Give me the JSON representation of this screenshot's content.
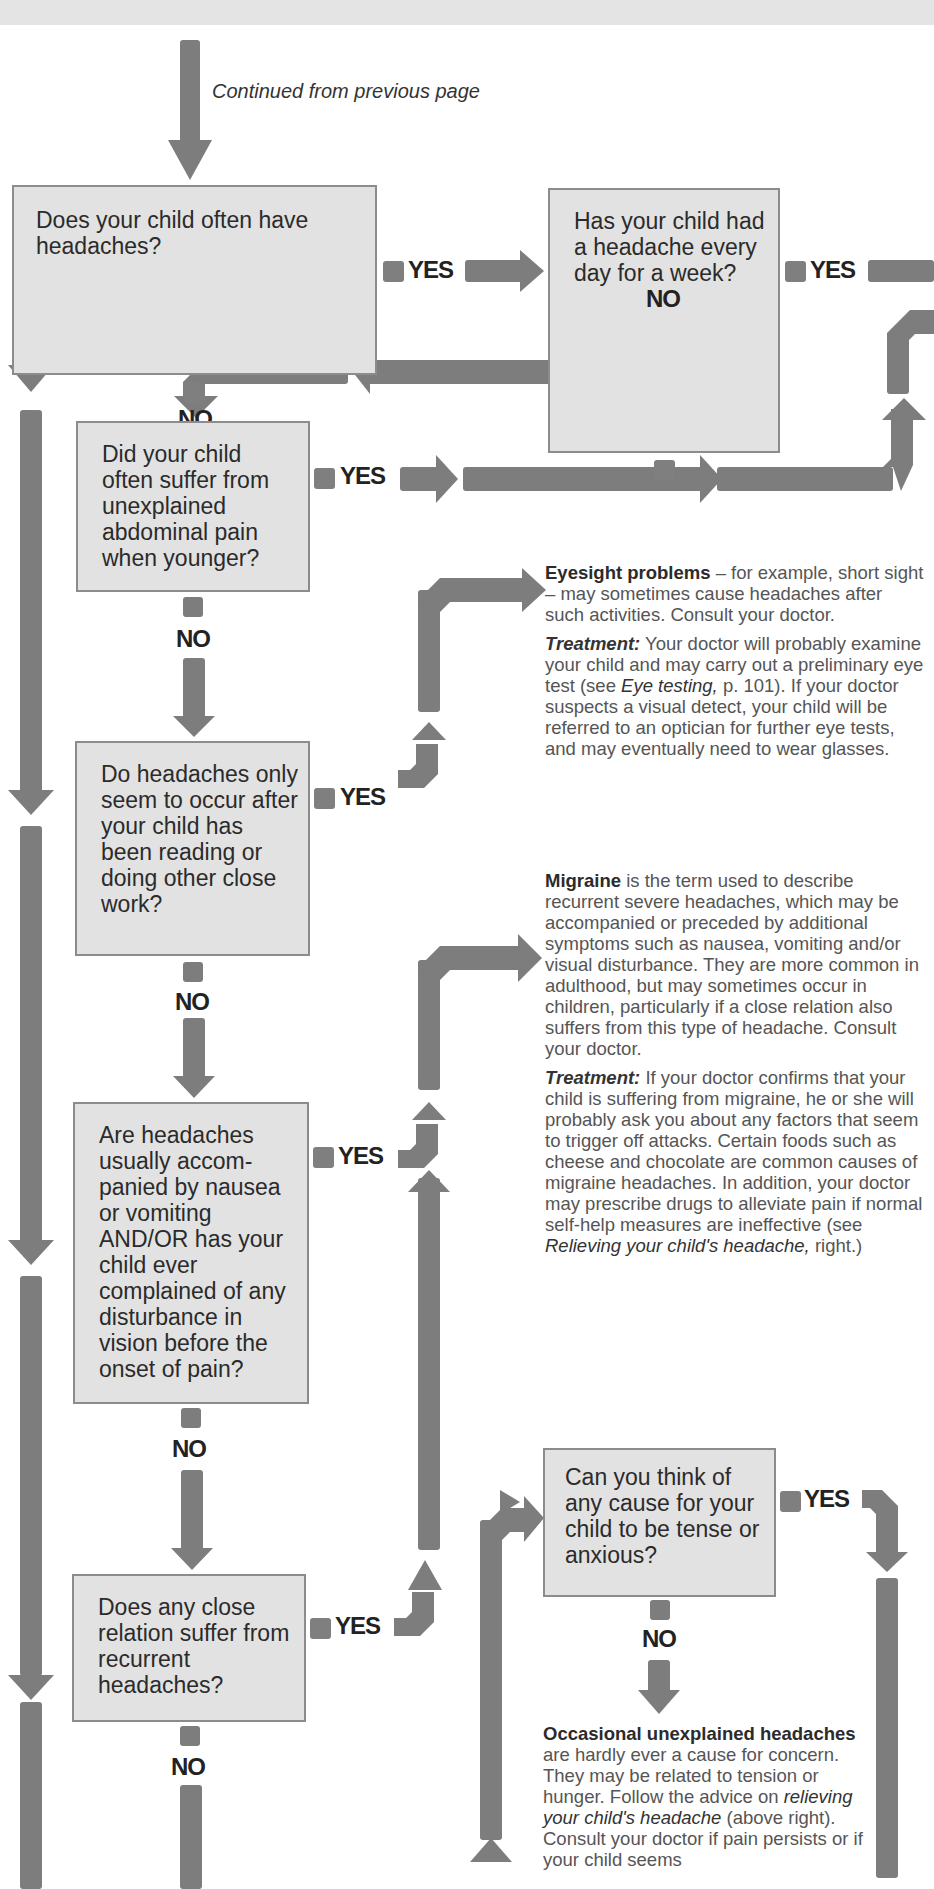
{
  "continued": "Continued from previous page",
  "labels": {
    "yes": "YES",
    "no": "NO"
  },
  "questions": [
    "Does your child often have headaches?",
    "Has your child had a headache every day for a week?",
    "Did your child often suffer from unexplained abdominal pain when younger?",
    "Do headaches only seem to occur after your child has been reading or doing other close work?",
    "Are headaches usually accom-panied by nausea or vomiting AND/OR has your child ever complained of any disturbance in vision before the onset of pain?",
    "Does any close relation suffer from recurrent headaches?",
    "Can you think of any cause for your child to be tense or anxious?"
  ],
  "eyesight": {
    "title": "Eyesight problems",
    "body": " – for example, short sight – may sometimes cause headaches after such activities. Consult your doctor.",
    "treatment_label": "Treatment:",
    "treatment_pre": " Your doctor will probably examine your child and may carry out a preliminary eye test (see ",
    "treatment_link": "Eye testing,",
    "treatment_post": " p. 101). If your doctor suspects a visual detect, your child will be referred to an optician for further eye tests, and may eventually need to wear glasses."
  },
  "migraine": {
    "title": "Migraine",
    "body": " is the term used to describe recurrent severe headaches, which may be accompanied or preceded by additional symptoms such as nausea, vomiting and/or visual disturbance. They are more common in adulthood, but may sometimes occur in children, particularly if a close relation also suffers from this type of headache. Consult your doctor.",
    "treatment_label": "Treatment:",
    "treatment_pre": " If your doctor confirms that your child is suffering from migraine, he or she will probably ask you about any factors that seem to trigger off attacks. Certain foods such as cheese and chocolate are common causes of migraine headaches. In addition, your doctor may prescribe drugs to alleviate pain if normal self-help measures are ineffective (see ",
    "treatment_link": "Relieving your child's headache,",
    "treatment_post": " right.)"
  },
  "occasional": {
    "title": "Occasional unexplained headaches",
    "body_pre": " are hardly ever a cause for concern. They may be related to tension or hunger. Follow the advice on ",
    "link": "relieving your child's headache",
    "body_post": " (above right). Consult your doctor if pain persists or if your child seems"
  },
  "colors": {
    "arrow": "#7d7d7d",
    "box_fill": "#e2e2e2",
    "box_border": "#8c8c8c",
    "top_band": "#e4e4e4"
  }
}
